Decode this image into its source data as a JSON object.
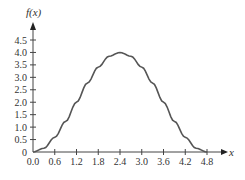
{
  "chart_data": {
    "type": "line",
    "title": "",
    "xlabel": "x",
    "ylabel": "f(x)",
    "xlim": [
      0,
      4.8
    ],
    "ylim": [
      0,
      4.5
    ],
    "grid": false,
    "legend": null,
    "x_ticks": [
      "0.0",
      "0.6",
      "1.2",
      "1.8",
      "2.4",
      "3.0",
      "3.6",
      "4.2",
      "4.8"
    ],
    "y_ticks": [
      "0",
      "0.5",
      "1.0",
      "1.5",
      "2.0",
      "2.5",
      "3.0",
      "3.5",
      "4.0",
      "4.5"
    ],
    "series": [
      {
        "name": "f(x)",
        "color": "#555555",
        "x": [
          0.0,
          0.3,
          0.6,
          0.9,
          1.2,
          1.5,
          1.8,
          2.1,
          2.4,
          2.7,
          3.0,
          3.3,
          3.6,
          3.9,
          4.2,
          4.5,
          4.8
        ],
        "values": [
          0.0,
          0.15,
          0.59,
          1.23,
          2.0,
          2.77,
          3.41,
          3.85,
          4.0,
          3.85,
          3.41,
          2.77,
          2.0,
          1.23,
          0.59,
          0.15,
          0.0
        ]
      }
    ]
  }
}
